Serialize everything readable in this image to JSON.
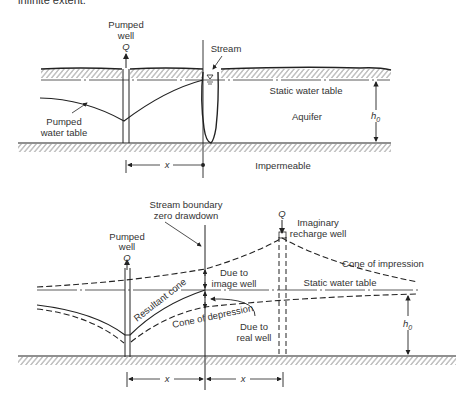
{
  "caption_fragment": "infinite extent.",
  "top_diagram": {
    "pumped_well_label": [
      "Pumped",
      "well"
    ],
    "discharge_symbol": "Q",
    "stream_label": "Stream",
    "static_water_table_label": "Static water table",
    "aquifer_label": "Aquifer",
    "pumped_water_table_label": [
      "Pumped",
      "water table"
    ],
    "thickness_label": "h",
    "thickness_subscript": "0",
    "impermeable_label": "Impermeable",
    "distance_label": "x"
  },
  "bottom_diagram": {
    "boundary_label": [
      "Stream boundary",
      "zero drawdown"
    ],
    "pumped_well_label": [
      "Pumped",
      "well"
    ],
    "discharge_symbol": "Q",
    "recharge_symbol": "Q",
    "recharge_well_label": [
      "Imaginary",
      "recharge well"
    ],
    "cone_of_impression_label": "Cone of impression",
    "due_to_image_well_label": [
      "Due to",
      "image well"
    ],
    "static_water_table_label": "Static water table",
    "resultant_cone_label": "Resultant cone",
    "cone_of_depression_label": "Cone of depression",
    "due_to_real_well_label": [
      "Due to",
      "real well"
    ],
    "thickness_label": "h",
    "thickness_subscript": "0",
    "distance_left_label": "x",
    "distance_right_label": "x"
  },
  "colors": {
    "line": "#222222",
    "text": "#333333",
    "hatch": "#555555"
  }
}
